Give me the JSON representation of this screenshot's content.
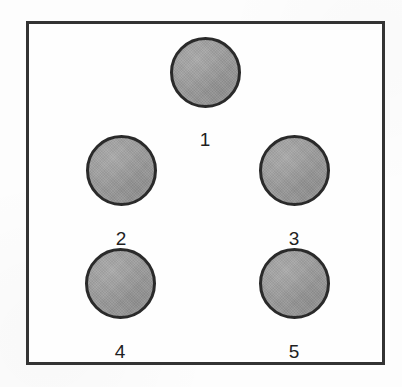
{
  "figure": {
    "type": "circle-arrangement-diagram",
    "background_color": "#fdfdfd",
    "frame": {
      "border_color": "#1c1c1c",
      "border_width_px": 3,
      "fill_color": "#fefefe",
      "x": 26,
      "y": 21,
      "width": 359,
      "height": 344
    },
    "circle_style": {
      "fill_color": "#9b9b9b",
      "outline_color": "#2a2a2a",
      "outline_width_px": 3
    },
    "label_style": {
      "color": "#1f1f1f",
      "font_size_px": 19
    },
    "circles": [
      {
        "label": "1",
        "row": 1,
        "position": "top-center",
        "center_x": 205,
        "center_y": 72,
        "diameter": 71,
        "label_x": 205,
        "label_y": 130
      },
      {
        "label": "2",
        "row": 2,
        "position": "middle-left",
        "center_x": 121,
        "center_y": 170,
        "diameter": 71,
        "label_x": 121,
        "label_y": 229
      },
      {
        "label": "3",
        "row": 2,
        "position": "middle-right",
        "center_x": 294,
        "center_y": 170,
        "diameter": 71,
        "label_x": 294,
        "label_y": 229
      },
      {
        "label": "4",
        "row": 3,
        "position": "bottom-left",
        "center_x": 120,
        "center_y": 283,
        "diameter": 71,
        "label_x": 120,
        "label_y": 342
      },
      {
        "label": "5",
        "row": 3,
        "position": "bottom-right",
        "center_x": 294,
        "center_y": 283,
        "diameter": 71,
        "label_x": 294,
        "label_y": 342
      }
    ]
  }
}
